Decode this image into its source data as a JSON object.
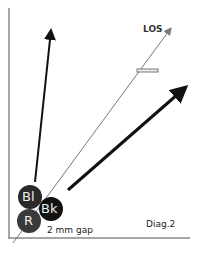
{
  "diagram": {
    "caption": "Diag.2",
    "los_label": "LOS",
    "gap_label": "2 mm gap",
    "balls": [
      {
        "label": "Bl",
        "cx": 30,
        "cy": 197,
        "r": 12,
        "color": "#2a2a2a"
      },
      {
        "label": "Bk",
        "cx": 51,
        "cy": 209,
        "r": 12,
        "color": "#111111"
      },
      {
        "label": "R",
        "cx": 29,
        "cy": 221,
        "r": 12,
        "color": "#3a3a3a"
      }
    ],
    "arrows": [
      {
        "name": "blue-ball-path",
        "from": [
          35,
          182
        ],
        "to": [
          52,
          26
        ],
        "width": 2
      },
      {
        "name": "black-ball-path",
        "from": [
          68,
          190
        ],
        "to": [
          190,
          84
        ],
        "width": 3
      },
      {
        "name": "line-of-sight",
        "from": [
          13,
          243
        ],
        "to": [
          171,
          28
        ],
        "width": 1
      }
    ],
    "colors": {
      "axis": "#888888",
      "arrow": "#111111",
      "los": "#777777"
    }
  }
}
